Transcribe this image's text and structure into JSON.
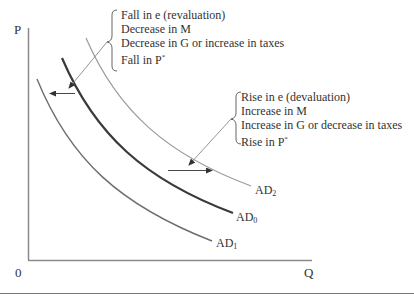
{
  "diagram": {
    "type": "aggregate-demand-shifts",
    "axes": {
      "y_label": "P",
      "x_label": "Q",
      "origin_label": "0"
    },
    "curves": [
      {
        "id": "AD1",
        "base": "AD",
        "sub": "1",
        "color": "#6e6e6e",
        "width": 1.4,
        "description": "shifted left"
      },
      {
        "id": "AD0",
        "base": "AD",
        "sub": "0",
        "color": "#3a3a3a",
        "width": 2.2,
        "description": "original"
      },
      {
        "id": "AD2",
        "base": "AD",
        "sub": "2",
        "color": "#9a9a9a",
        "width": 1.2,
        "description": "shifted right"
      }
    ],
    "left_shift_note": {
      "lines": [
        "Fall in e (revaluation)",
        "Decrease in M",
        "Decrease in G or increase in taxes",
        "Fall in P"
      ],
      "last_line_superscript": "*",
      "arrow_direction": "left"
    },
    "right_shift_note": {
      "lines": [
        "Rise in e (devaluation)",
        "Increase in M",
        "Increase in G or decrease in taxes",
        "Rise in P"
      ],
      "last_line_superscript": "*",
      "arrow_direction": "right"
    }
  }
}
